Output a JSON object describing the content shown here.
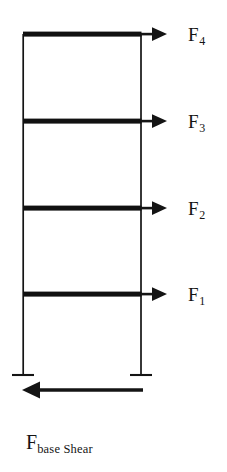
{
  "diagram": {
    "type": "structural-frame-lateral-force-diagram",
    "colors": {
      "ink": "#141414",
      "beam": "#111111",
      "background": "#ffffff"
    },
    "frame": {
      "stories": 4,
      "left_column_x": 23,
      "right_column_x": 141,
      "top_y": 34,
      "base_y": 375,
      "column_line_width": 1.6,
      "beam_thickness": 5,
      "base_plate_half_width": 11
    },
    "story_forces": [
      {
        "id": "F4",
        "label_base": "F",
        "label_sub": "4",
        "beam_y": 34,
        "label_x": 188,
        "label_y": 27,
        "direction": "right",
        "arrow_tip_x": 167
      },
      {
        "id": "F3",
        "label_base": "F",
        "label_sub": "3",
        "beam_y": 121,
        "label_x": 188,
        "label_y": 114,
        "direction": "right",
        "arrow_tip_x": 167
      },
      {
        "id": "F2",
        "label_base": "F",
        "label_sub": "2",
        "beam_y": 208,
        "label_x": 188,
        "label_y": 201,
        "direction": "right",
        "arrow_tip_x": 167
      },
      {
        "id": "F1",
        "label_base": "F",
        "label_sub": "1",
        "beam_y": 294,
        "label_x": 188,
        "label_y": 287,
        "direction": "right",
        "arrow_tip_x": 167
      }
    ],
    "base_shear": {
      "label_base": "F",
      "label_sub": "base Shear",
      "full_text": "Fbase Shear",
      "arrow_y": 390,
      "arrow_tail_x": 143,
      "arrow_tip_x": 22,
      "direction": "left",
      "shaft_thickness": 3.2
    }
  }
}
